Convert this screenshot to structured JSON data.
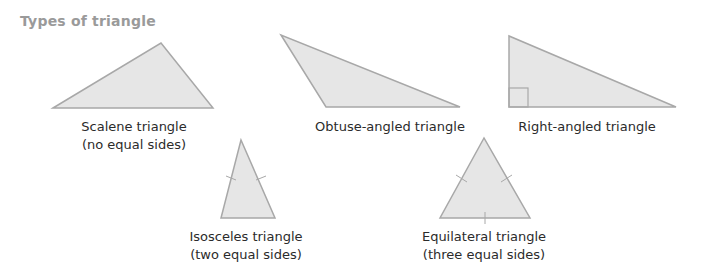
{
  "title": "Types of triangle",
  "colors": {
    "fill": "#e6e6e6",
    "stroke": "#a8a8a8",
    "title": "#9a9a9a",
    "text": "#2b2b2b"
  },
  "triangles": [
    {
      "name": "Scalene triangle",
      "note": "(no equal sides)",
      "points": "53,108 161,43 213,108",
      "label_x": 134,
      "label_y": 118
    },
    {
      "name": "Obtuse-angled triangle",
      "note": "",
      "points": "281,35 326,107 460,107",
      "label_x": 390,
      "label_y": 118
    },
    {
      "name": "Right-angled triangle",
      "note": "",
      "points": "509,36 509,107 676,107",
      "label_x": 587,
      "label_y": 118
    },
    {
      "name": "Isosceles triangle",
      "note": "(two equal sides)",
      "points": "241,140 221,218 275,218",
      "label_x": 246,
      "label_y": 228
    },
    {
      "name": "Equilateral triangle",
      "note": "(three equal sides)",
      "points": "484,138 440,218 530,218",
      "label_x": 484,
      "label_y": 228
    }
  ]
}
